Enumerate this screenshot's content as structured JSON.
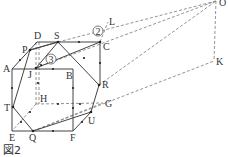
{
  "caption": "図2",
  "points": {
    "A": {
      "label": "A",
      "x": 12,
      "y": 69,
      "lx": 3,
      "ly": 72
    },
    "D": {
      "label": "D",
      "x": 37,
      "y": 42,
      "lx": 34,
      "ly": 39
    },
    "S": {
      "label": "S",
      "x": 58,
      "y": 42,
      "lx": 54,
      "ly": 39
    },
    "P": {
      "label": "P",
      "x": 30,
      "y": 50,
      "lx": 22,
      "ly": 52
    },
    "C": {
      "label": "C",
      "x": 100,
      "y": 42,
      "lx": 103,
      "ly": 50
    },
    "J": {
      "label": "J",
      "x": 36,
      "y": 68,
      "lx": 28,
      "ly": 78
    },
    "B": {
      "label": "B",
      "x": 73,
      "y": 69,
      "lx": 66,
      "ly": 79
    },
    "R": {
      "label": "R",
      "x": 99,
      "y": 85,
      "lx": 102,
      "ly": 88
    },
    "H": {
      "label": "H",
      "x": 36,
      "y": 104,
      "lx": 40,
      "ly": 102
    },
    "G": {
      "label": "G",
      "x": 103,
      "y": 103,
      "lx": 105,
      "ly": 107
    },
    "T": {
      "label": "T",
      "x": 13,
      "y": 107,
      "lx": 4,
      "ly": 110
    },
    "U": {
      "label": "U",
      "x": 91,
      "y": 112,
      "lx": 88,
      "ly": 124
    },
    "E": {
      "label": "E",
      "x": 12,
      "y": 131,
      "lx": 9,
      "ly": 141
    },
    "Q": {
      "label": "Q",
      "x": 33,
      "y": 131,
      "lx": 30,
      "ly": 141
    },
    "F": {
      "label": "F",
      "x": 73,
      "y": 131,
      "lx": 70,
      "ly": 141
    },
    "L": {
      "label": "L",
      "x": 108,
      "y": 22,
      "lx": 109,
      "ly": 25
    },
    "O": {
      "label": "O",
      "x": 216,
      "y": 1,
      "lx": 218,
      "ly": 6
    },
    "K": {
      "label": "K",
      "x": 214,
      "y": 61,
      "lx": 216,
      "ly": 66
    }
  },
  "circled_labels": [
    {
      "text": "2",
      "x": 98,
      "y": 31
    },
    {
      "text": "3",
      "x": 51,
      "y": 59
    }
  ]
}
